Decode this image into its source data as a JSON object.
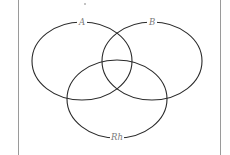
{
  "diagram": {
    "type": "venn",
    "sets": [
      {
        "id": "A",
        "label": "A",
        "cx": 82,
        "cy": 61,
        "rx": 50,
        "ry": 39,
        "label_x": 82,
        "label_y": 25
      },
      {
        "id": "B",
        "label": "B",
        "cx": 152,
        "cy": 61,
        "rx": 50,
        "ry": 39,
        "label_x": 152,
        "label_y": 25
      },
      {
        "id": "Rh",
        "label": "Rh",
        "cx": 117,
        "cy": 99,
        "rx": 50,
        "ry": 39,
        "label_x": 117,
        "label_y": 140
      }
    ],
    "marker": "*"
  },
  "colors": {
    "stroke": "#2a2a2a",
    "label": "#7a7a7a",
    "frame": "#9a9a9a"
  }
}
